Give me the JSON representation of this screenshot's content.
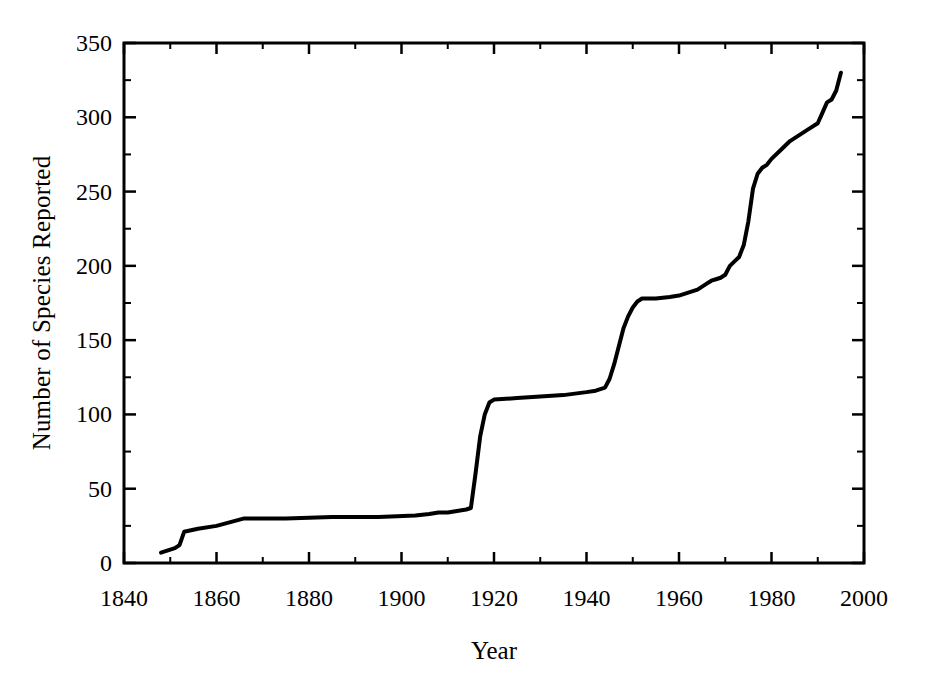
{
  "chart_data": {
    "type": "line",
    "title": "",
    "xlabel": "Year",
    "ylabel": "Number of Species Reported",
    "xlim": [
      1840,
      2000
    ],
    "ylim": [
      0,
      350
    ],
    "xticks": [
      1840,
      1860,
      1880,
      1900,
      1920,
      1940,
      1960,
      1980,
      2000
    ],
    "xtick_labels": [
      "1840",
      "1860",
      "1880",
      "1900",
      "1920",
      "1940",
      "1960",
      "1980",
      "2000"
    ],
    "yticks": [
      0,
      50,
      100,
      150,
      200,
      250,
      300,
      350
    ],
    "ytick_labels": [
      "0",
      "50",
      "100",
      "150",
      "200",
      "250",
      "300",
      "350"
    ],
    "minor_xtick_interval": 10,
    "minor_ytick_interval": 25,
    "grid": false,
    "legend": null,
    "line_color": "#000000",
    "line_width": 4,
    "series": [
      {
        "name": "Cumulative species reported",
        "x": [
          1848,
          1850,
          1851,
          1852,
          1853,
          1856,
          1860,
          1866,
          1875,
          1885,
          1895,
          1903,
          1906,
          1908,
          1910,
          1912,
          1914,
          1915,
          1916,
          1917,
          1918,
          1919,
          1920,
          1925,
          1930,
          1935,
          1940,
          1942,
          1944,
          1945,
          1946,
          1947,
          1948,
          1949,
          1950,
          1951,
          1952,
          1955,
          1958,
          1960,
          1962,
          1964,
          1965,
          1966,
          1967,
          1968,
          1969,
          1970,
          1971,
          1972,
          1973,
          1974,
          1975,
          1976,
          1977,
          1978,
          1979,
          1980,
          1982,
          1984,
          1986,
          1988,
          1990,
          1991,
          1992,
          1993,
          1994,
          1995
        ],
        "y": [
          7,
          9,
          10,
          12,
          21,
          23,
          25,
          30,
          30,
          31,
          31,
          32,
          33,
          34,
          34,
          35,
          36,
          37,
          60,
          85,
          100,
          108,
          110,
          111,
          112,
          113,
          115,
          116,
          118,
          124,
          134,
          146,
          158,
          166,
          172,
          176,
          178,
          178,
          179,
          180,
          182,
          184,
          186,
          188,
          190,
          191,
          192,
          194,
          200,
          203,
          206,
          214,
          230,
          252,
          262,
          266,
          268,
          272,
          278,
          284,
          288,
          292,
          296,
          303,
          310,
          312,
          318,
          330
        ]
      }
    ]
  }
}
